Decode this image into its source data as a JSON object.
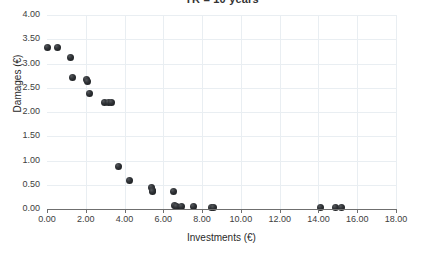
{
  "chart_data": {
    "type": "scatter",
    "title": "TR = 10 years",
    "xlabel": "Investments (€)",
    "ylabel": "Damages (€)",
    "xlim": [
      0,
      18
    ],
    "ylim": [
      0,
      4
    ],
    "xticks": [
      "0.00",
      "2.00",
      "4.00",
      "6.00",
      "8.00",
      "10.00",
      "12.00",
      "14.00",
      "16.00",
      "18.00"
    ],
    "xtick_values": [
      0,
      2,
      4,
      6,
      8,
      10,
      12,
      14,
      16,
      18
    ],
    "yticks": [
      "0.00",
      "0.50",
      "1.00",
      "1.50",
      "2.00",
      "2.50",
      "3.00",
      "3.50",
      "4.00"
    ],
    "ytick_values": [
      0,
      0.5,
      1.0,
      1.5,
      2.0,
      2.5,
      3.0,
      3.5,
      4.0
    ],
    "grid": true,
    "legend": null,
    "marker_color": "#232629",
    "series": [
      {
        "name": "Damages vs Investments",
        "points": [
          [
            0.05,
            3.34
          ],
          [
            0.52,
            3.34
          ],
          [
            1.2,
            3.12
          ],
          [
            1.33,
            2.72
          ],
          [
            2.05,
            2.68
          ],
          [
            2.08,
            2.62
          ],
          [
            2.18,
            2.39
          ],
          [
            2.98,
            2.19
          ],
          [
            3.18,
            2.19
          ],
          [
            3.32,
            2.19
          ],
          [
            3.68,
            0.87
          ],
          [
            4.23,
            0.58
          ],
          [
            5.38,
            0.45
          ],
          [
            5.42,
            0.39
          ],
          [
            5.45,
            0.36
          ],
          [
            6.52,
            0.36
          ],
          [
            6.58,
            0.07
          ],
          [
            6.7,
            0.06
          ],
          [
            6.95,
            0.05
          ],
          [
            7.58,
            0.05
          ],
          [
            8.48,
            0.03
          ],
          [
            8.58,
            0.03
          ],
          [
            14.1,
            0.03
          ],
          [
            14.88,
            0.03
          ],
          [
            15.2,
            0.03
          ]
        ]
      }
    ]
  }
}
